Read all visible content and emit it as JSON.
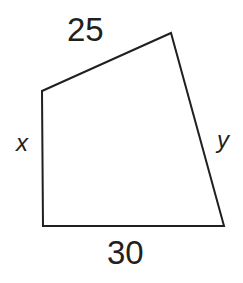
{
  "figure": {
    "kind": "geometry-diagram",
    "shape": "quadrilateral",
    "background_color": "#ffffff",
    "stroke_color": "#231f20",
    "stroke_width": 2,
    "width": 243,
    "height": 283,
    "vertices": [
      {
        "name": "top-left",
        "x": 42,
        "y": 91
      },
      {
        "name": "top-right",
        "x": 171,
        "y": 33
      },
      {
        "name": "bottom-right",
        "x": 224,
        "y": 226
      },
      {
        "name": "bottom-left",
        "x": 43,
        "y": 226
      }
    ],
    "path": "M 42 91 L 171 33 L 224 226 L 43 226 Z",
    "sides": [
      {
        "id": "top",
        "label": "25",
        "style": "upright",
        "from": "top-left",
        "to": "top-right"
      },
      {
        "id": "right",
        "label": "y",
        "style": "italic",
        "from": "top-right",
        "to": "bottom-right"
      },
      {
        "id": "bottom",
        "label": "30",
        "style": "upright",
        "from": "bottom-left",
        "to": "bottom-right"
      },
      {
        "id": "left",
        "label": "x",
        "style": "italic",
        "from": "top-left",
        "to": "bottom-left"
      }
    ]
  }
}
